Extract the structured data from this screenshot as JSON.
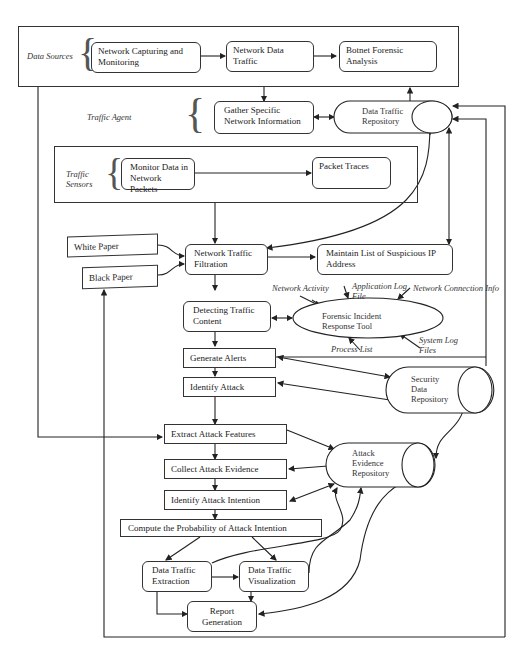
{
  "groups": {
    "data_sources": {
      "label": "Data Sources"
    },
    "traffic_agent": {
      "label": "Traffic Agent"
    },
    "traffic_sensors": {
      "label": "Traffic Sensors"
    }
  },
  "nodes": {
    "network_capturing": "Network Capturing and Monitoring",
    "network_data_traffic": "Network Data Traffic",
    "botnet_forensic": "Botnet Forensic Analysis",
    "gather_specific": "Gather Specific Network Information",
    "data_traffic_repository": "Data Traffic Repository",
    "monitor_data": "Monitor Data in Network Packets",
    "packet_traces": "Packet Traces",
    "white_paper": "White Paper",
    "black_paper": "Black Paper",
    "network_traffic_filtration": "Network Traffic Filtration",
    "maintain_list": "Maintain List of Suspicious IP Address",
    "detecting_traffic": "Detecting Traffic Content",
    "forensic_tool": "Forensic Incident Response Tool",
    "generate_alerts": "Generate Alerts",
    "identify_attack": "Identify Attack",
    "security_repo": "Security Data Repository",
    "extract_features": "Extract Attack Features",
    "collect_evidence": "Collect Attack Evidence",
    "identify_intention": "Identify Attack Intention",
    "attack_evidence_repo": "Attack Evidence Repository",
    "compute_probability": "Compute the Probability of Attack Intention",
    "data_extraction": "Data Traffic Extraction",
    "data_visualization": "Data Traffic Visualization",
    "report_generation": "Report Generation"
  },
  "tool_inputs": {
    "network_activity": "Network Activity",
    "application_log": "Application Log File",
    "network_connection": "Network Connection Info",
    "process_list": "Process List",
    "system_log": "System Log Files"
  }
}
